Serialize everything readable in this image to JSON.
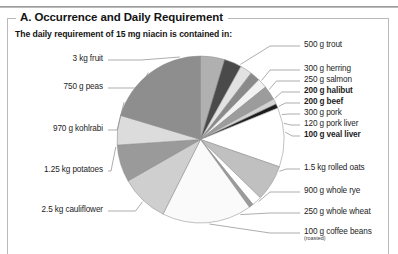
{
  "page": {
    "section_title": "A. Occurrence and Daily Requirement",
    "subtitle": "The daily requirement of 15 mg niacin is contained in:"
  },
  "chart_data": {
    "type": "pie",
    "title": "A. Occurrence and Daily Requirement",
    "subtitle": "The daily requirement of 15 mg niacin is contained in:",
    "xlabel": "",
    "ylabel": "",
    "legend_position": "callout-labels",
    "grid": false,
    "note": "Slice sizes are proportional to the food quantity needed to supply 15 mg of niacin; values read off the drawn wedge angles.",
    "categories": [
      "500 g trout",
      "300 g herring",
      "250 g salmon",
      "200 g halibut",
      "200 g beef",
      "300 g pork",
      "120 g pork liver",
      "100 g veal liver",
      "1.5 kg rolled oats",
      "900 g whole rye",
      "250 g whole wheat",
      "100 g coffee beans (roasted)",
      "2.5 kg cauliflower",
      "1.25 kg potatoes",
      "970 g kohlrabi",
      "750 g peas",
      "3 kg fruit"
    ],
    "values": [
      22,
      16,
      11,
      9,
      9,
      13,
      5,
      4,
      54,
      33,
      9,
      4,
      82,
      44,
      34,
      27,
      96
    ],
    "slice_colors": [
      "#b0b0b0",
      "#4a4a4a",
      "#e2e2e2",
      "#8a8a8a",
      "#f2f2f2",
      "#9c9c9c",
      "#d3d3d3",
      "#1c1c1c",
      "#ffffff",
      "#c0c0c0",
      "#ffffff",
      "#9a9a9a",
      "#fafafa",
      "#cfcfcf",
      "#9a9a9a",
      "#dcdcdc",
      "#8e8e8e"
    ]
  },
  "labels": {
    "right": [
      {
        "id": "trout",
        "text": "500 g trout",
        "bold": false,
        "sub": ""
      },
      {
        "id": "herring",
        "text": "300 g herring",
        "bold": false,
        "sub": ""
      },
      {
        "id": "salmon",
        "text": "250 g salmon",
        "bold": false,
        "sub": ""
      },
      {
        "id": "halibut",
        "text": "200 g halibut",
        "bold": true,
        "sub": ""
      },
      {
        "id": "beef",
        "text": "200 g beef",
        "bold": true,
        "sub": ""
      },
      {
        "id": "pork",
        "text": "300 g pork",
        "bold": false,
        "sub": ""
      },
      {
        "id": "pork-liver",
        "text": "120 g pork liver",
        "bold": false,
        "sub": ""
      },
      {
        "id": "veal-liver",
        "text": "100 g veal liver",
        "bold": true,
        "sub": ""
      },
      {
        "id": "rolled-oats",
        "text": "1.5 kg rolled oats",
        "bold": false,
        "sub": ""
      },
      {
        "id": "whole-rye",
        "text": "900 g whole rye",
        "bold": false,
        "sub": ""
      },
      {
        "id": "whole-wheat",
        "text": "250 g whole wheat",
        "bold": false,
        "sub": ""
      },
      {
        "id": "coffee-beans",
        "text": "100 g coffee beans",
        "bold": false,
        "sub": "(roasted)"
      }
    ],
    "left": [
      {
        "id": "fruit",
        "text": "3 kg fruit",
        "bold": false,
        "sub": ""
      },
      {
        "id": "peas",
        "text": "750 g peas",
        "bold": false,
        "sub": ""
      },
      {
        "id": "kohlrabi",
        "text": "970 g kohlrabi",
        "bold": false,
        "sub": ""
      },
      {
        "id": "potatoes",
        "text": "1.25 kg potatoes",
        "bold": false,
        "sub": ""
      },
      {
        "id": "cauliflower",
        "text": "2.5 kg cauliflower",
        "bold": false,
        "sub": ""
      }
    ]
  }
}
